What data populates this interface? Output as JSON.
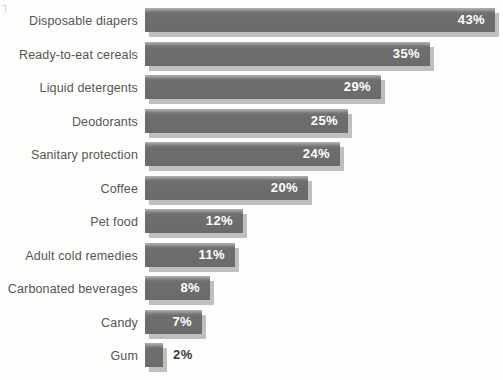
{
  "artifact": {
    "glyph": "┐"
  },
  "chart_data": {
    "type": "bar",
    "orientation": "horizontal",
    "title": "",
    "subtitle": "",
    "xlabel": "",
    "ylabel": "",
    "grid": false,
    "legend": false,
    "value_suffix": "%",
    "xlim": [
      0,
      43
    ],
    "axis_ticks": [],
    "categories": [
      "Disposable diapers",
      "Ready-to-eat cereals",
      "Liquid detergents",
      "Deodorants",
      "Sanitary protection",
      "Coffee",
      "Pet food",
      "Adult cold remedies",
      "Carbonated beverages",
      "Candy",
      "Gum"
    ],
    "values": [
      43,
      35,
      29,
      25,
      24,
      20,
      12,
      11,
      8,
      7,
      2
    ],
    "labels": [
      "43%",
      "35%",
      "29%",
      "25%",
      "24%",
      "20%",
      "12%",
      "11%",
      "8%",
      "7%",
      "2%"
    ],
    "label_position": [
      "inside",
      "inside",
      "inside",
      "inside",
      "inside",
      "inside",
      "inside",
      "inside",
      "inside",
      "inside",
      "outside"
    ],
    "colors": {
      "bar_fill": "#6e6e6e",
      "bar_shadow": "#bfbfbd",
      "background": "#fdfdfc",
      "label_text": "#555553",
      "value_text_inside": "#ffffff",
      "value_text_outside": "#3a3a38"
    }
  }
}
